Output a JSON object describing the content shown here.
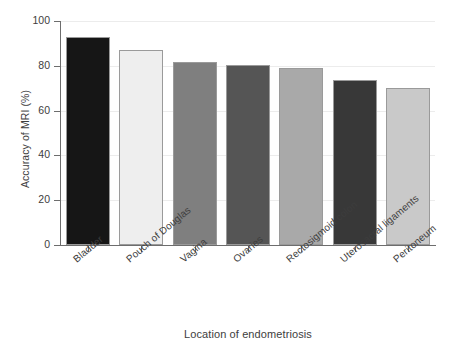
{
  "chart_data": {
    "type": "bar",
    "title": "",
    "subtitle": "",
    "xlabel": "Location of endometriosis",
    "ylabel": "Accuracy of MRI (%)",
    "categories": [
      "Bladder",
      "Pouch of Douglas",
      "Vagina",
      "Ovaries",
      "Rectosigmoid colon",
      "Uterosacral ligaments",
      "Peritoneum"
    ],
    "values": [
      93,
      87,
      81.5,
      80.5,
      79,
      73.5,
      70
    ],
    "ylim": [
      0,
      100
    ],
    "yticks": [
      0,
      20,
      40,
      60,
      80,
      100
    ],
    "ytick_labels": [
      "0",
      "20",
      "40",
      "60",
      "80",
      "100"
    ],
    "grid": true,
    "grid_axis": "y",
    "legend": false,
    "legend_position": "none",
    "bar_colors": [
      "#161616",
      "#eeeeee",
      "#7f7f7f",
      "#555555",
      "#a9a9a9",
      "#383838",
      "#c9c9c9"
    ],
    "bar_edge_color": "#9a9a9a"
  },
  "axis": {
    "line_color": "#6d6d6d",
    "grid_color": "#ececec",
    "text_color": "#3d3d3d"
  }
}
